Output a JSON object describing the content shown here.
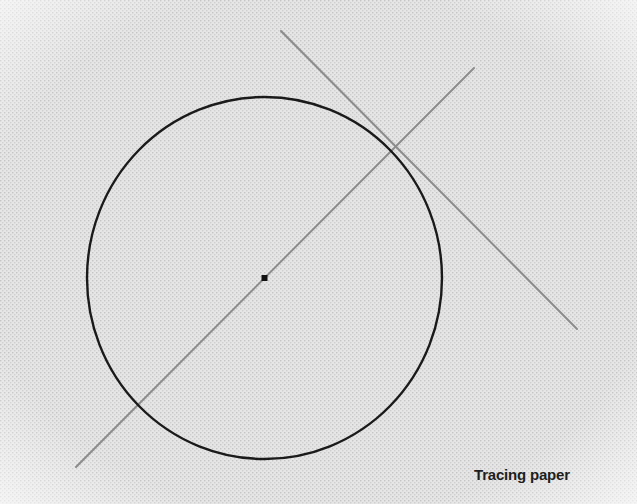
{
  "figure": {
    "label": "Tracing paper",
    "elements": [
      "circle",
      "center-point",
      "diameter-line",
      "tangent-line"
    ]
  },
  "colors": {
    "paper": "#e4e4e4",
    "paper_dots": "#c8c8c8",
    "circle_stroke": "#1a1a1a",
    "guide_lines": "#8c8c8c",
    "center_point": "#111111",
    "caption": "#1e1e1e"
  }
}
